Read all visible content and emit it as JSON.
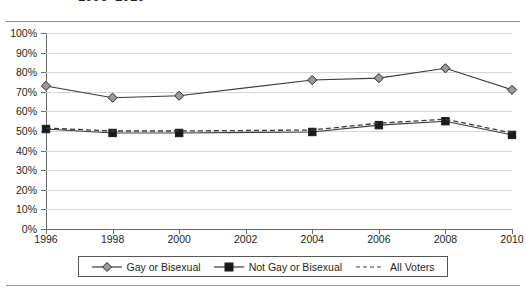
{
  "title": "1996–2010",
  "chart_data": {
    "type": "line",
    "title": "1996–2010",
    "xlabel": "",
    "ylabel": "",
    "x": [
      1996,
      1998,
      2000,
      2002,
      2004,
      2006,
      2008,
      2010
    ],
    "categories": [
      "1996",
      "1998",
      "2000",
      "2002",
      "2004",
      "2006",
      "2008",
      "2010"
    ],
    "xlim": [
      1996,
      2010
    ],
    "ylim": [
      0,
      100
    ],
    "ytick_labels": [
      "0%",
      "10%",
      "20%",
      "30%",
      "40%",
      "50%",
      "60%",
      "70%",
      "80%",
      "90%",
      "100%"
    ],
    "ytick_values": [
      0,
      10,
      20,
      30,
      40,
      50,
      60,
      70,
      80,
      90,
      100
    ],
    "grid": true,
    "legend_position": "bottom",
    "series": [
      {
        "name": "Gay or Bisexual",
        "marker": "diamond",
        "linestyle": "solid",
        "color": "#3a3a3a",
        "marker_fill": "#9a9a9a",
        "x": [
          1996,
          1998,
          2000,
          2004,
          2006,
          2008,
          2010
        ],
        "values": [
          73,
          67,
          68,
          76,
          77,
          82,
          71
        ]
      },
      {
        "name": "Not Gay or Bisexual",
        "marker": "square",
        "linestyle": "solid",
        "color": "#3a3a3a",
        "marker_fill": "#1a1a1a",
        "x": [
          1996,
          1998,
          2000,
          2004,
          2006,
          2008,
          2010
        ],
        "values": [
          51,
          49,
          49,
          49.5,
          53,
          55,
          48
        ]
      },
      {
        "name": "All Voters",
        "marker": "none",
        "linestyle": "dashed",
        "color": "#3a3a3a",
        "marker_fill": "none",
        "x": [
          1996,
          1998,
          2000,
          2004,
          2006,
          2008,
          2010
        ],
        "values": [
          51.5,
          50,
          50,
          50.5,
          54,
          56,
          49
        ]
      }
    ]
  },
  "legend": {
    "items": [
      {
        "label": "Gay or Bisexual"
      },
      {
        "label": "Not Gay or Bisexual"
      },
      {
        "label": "All Voters"
      }
    ]
  }
}
